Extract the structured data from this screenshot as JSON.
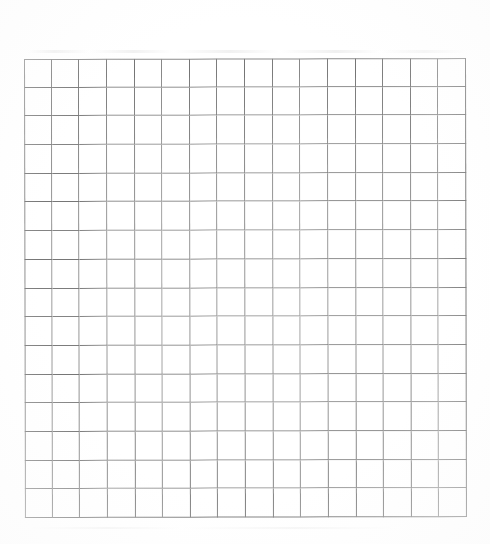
{
  "document": {
    "kind": "blank-grid-sheet",
    "description": "Blank scanned graph-paper grid",
    "background_color": "#ffffff",
    "page_width": 490,
    "page_height": 544
  },
  "grid": {
    "columns": 16,
    "rows": 16,
    "cell_width": 27.6,
    "cell_height": 28.7,
    "origin_x": 24,
    "origin_y": 59,
    "width": 442,
    "height": 459,
    "line_color": "#7c7c7c",
    "border_color": "#8a8a8a",
    "line_width": 1,
    "cell_fill": "#ffffff",
    "cell_labels": [
      [
        "",
        "",
        "",
        "",
        "",
        "",
        "",
        "",
        "",
        "",
        "",
        "",
        "",
        "",
        "",
        ""
      ],
      [
        "",
        "",
        "",
        "",
        "",
        "",
        "",
        "",
        "",
        "",
        "",
        "",
        "",
        "",
        "",
        ""
      ],
      [
        "",
        "",
        "",
        "",
        "",
        "",
        "",
        "",
        "",
        "",
        "",
        "",
        "",
        "",
        "",
        ""
      ],
      [
        "",
        "",
        "",
        "",
        "",
        "",
        "",
        "",
        "",
        "",
        "",
        "",
        "",
        "",
        "",
        ""
      ],
      [
        "",
        "",
        "",
        "",
        "",
        "",
        "",
        "",
        "",
        "",
        "",
        "",
        "",
        "",
        "",
        ""
      ],
      [
        "",
        "",
        "",
        "",
        "",
        "",
        "",
        "",
        "",
        "",
        "",
        "",
        "",
        "",
        "",
        ""
      ],
      [
        "",
        "",
        "",
        "",
        "",
        "",
        "",
        "",
        "",
        "",
        "",
        "",
        "",
        "",
        "",
        ""
      ],
      [
        "",
        "",
        "",
        "",
        "",
        "",
        "",
        "",
        "",
        "",
        "",
        "",
        "",
        "",
        "",
        ""
      ],
      [
        "",
        "",
        "",
        "",
        "",
        "",
        "",
        "",
        "",
        "",
        "",
        "",
        "",
        "",
        "",
        ""
      ],
      [
        "",
        "",
        "",
        "",
        "",
        "",
        "",
        "",
        "",
        "",
        "",
        "",
        "",
        "",
        "",
        ""
      ],
      [
        "",
        "",
        "",
        "",
        "",
        "",
        "",
        "",
        "",
        "",
        "",
        "",
        "",
        "",
        "",
        ""
      ],
      [
        "",
        "",
        "",
        "",
        "",
        "",
        "",
        "",
        "",
        "",
        "",
        "",
        "",
        "",
        "",
        ""
      ],
      [
        "",
        "",
        "",
        "",
        "",
        "",
        "",
        "",
        "",
        "",
        "",
        "",
        "",
        "",
        "",
        ""
      ],
      [
        "",
        "",
        "",
        "",
        "",
        "",
        "",
        "",
        "",
        "",
        "",
        "",
        "",
        "",
        "",
        ""
      ],
      [
        "",
        "",
        "",
        "",
        "",
        "",
        "",
        "",
        "",
        "",
        "",
        "",
        "",
        "",
        "",
        ""
      ],
      [
        "",
        "",
        "",
        "",
        "",
        "",
        "",
        "",
        "",
        "",
        "",
        "",
        "",
        "",
        "",
        ""
      ]
    ]
  },
  "margins": {
    "top_text": "",
    "bottom_text": "",
    "left_text": "",
    "right_text": ""
  }
}
